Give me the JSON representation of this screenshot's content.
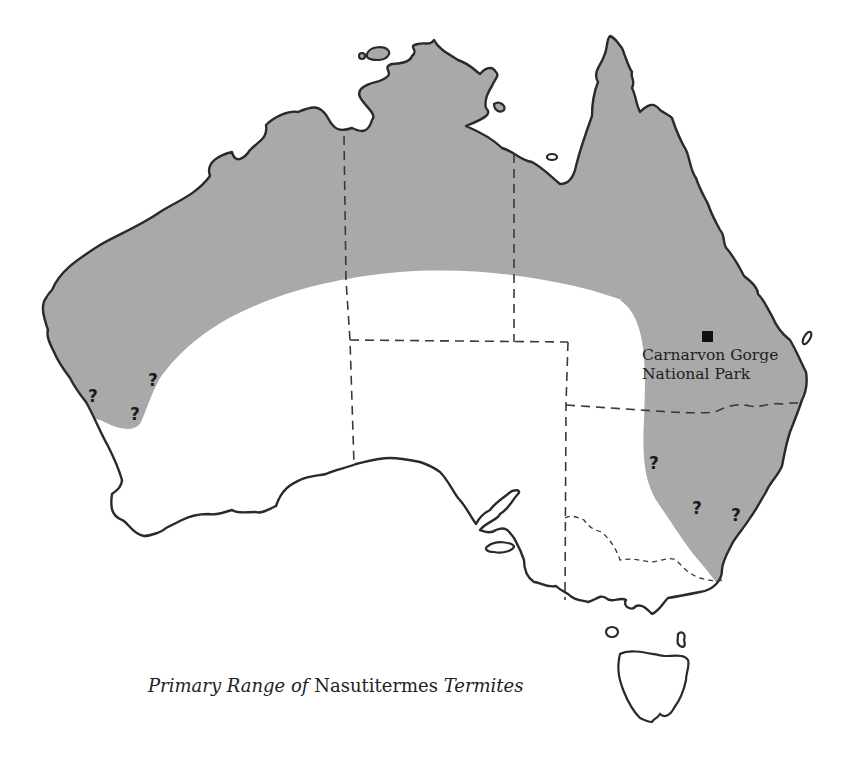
{
  "map": {
    "region": "Australia",
    "shaded_color": "#a9a9a9",
    "outline_color": "#2a2a2a",
    "background": "#ffffff",
    "caption": {
      "part1": "Primary Range ",
      "part2": "of",
      "part3": " Nasutitermes ",
      "part4": "Termites"
    },
    "landmark": {
      "label_line1": "Carnarvon Gorge",
      "label_line2": "National Park",
      "marker": "square-marker"
    },
    "uncertain_markers": [
      {
        "symbol": "?",
        "x": 88,
        "y": 388
      },
      {
        "symbol": "?",
        "x": 148,
        "y": 372
      },
      {
        "symbol": "?",
        "x": 130,
        "y": 406
      },
      {
        "symbol": "?",
        "x": 649,
        "y": 455
      },
      {
        "symbol": "?",
        "x": 692,
        "y": 500
      },
      {
        "symbol": "?",
        "x": 731,
        "y": 507
      }
    ]
  }
}
